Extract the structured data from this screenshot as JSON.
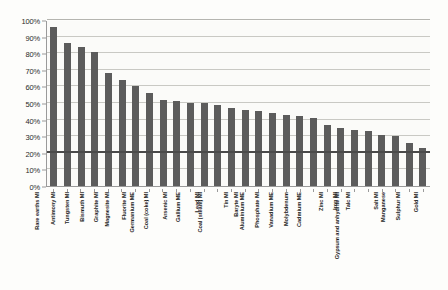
{
  "chart_data": {
    "type": "bar",
    "title": "",
    "subtitle": "",
    "xlabel": "",
    "ylabel": "",
    "ylim": [
      0,
      100
    ],
    "ytick_labels": [
      "0%",
      "10%",
      "20%",
      "30%",
      "40%",
      "50%",
      "60%",
      "70%",
      "80%",
      "90%",
      "100%"
    ],
    "ytick_values": [
      0,
      10,
      20,
      30,
      40,
      50,
      60,
      70,
      80,
      90,
      100
    ],
    "grid": true,
    "legend": "none",
    "bar_color": "#5c5c5c",
    "reference_line": {
      "value": 20,
      "label": "",
      "color": "#4a4a4a"
    },
    "categories": [
      "Rare earths MI",
      "Antimony MI",
      "Tungsten MI",
      "Bismuth MI",
      "Graphite MI",
      "Magnesite MI",
      "Fluorite MI",
      "Germanium ME",
      "Coal (coke) MI",
      "Arsenic MI",
      "Gallium ME",
      "Lead MI",
      "Coal (steam) MI",
      "Tin MI",
      "Baryte MI",
      "Aluminium ME",
      "Phosphate MI",
      "Vanadium ME",
      "Molybdenum",
      "Cadmium ME",
      "Zinc MI",
      "Iron MI",
      "Talc MI",
      "Gypsum and anhydrite MI",
      "Salt MI",
      "Manganese",
      "Sulphur MI",
      "Gold MI"
    ],
    "values": [
      96,
      86,
      84,
      81,
      68,
      64,
      60,
      56,
      52,
      51,
      50,
      50,
      49,
      47,
      46,
      45,
      44,
      43,
      42,
      41,
      37,
      35,
      34,
      33,
      31,
      30,
      26,
      23
    ]
  }
}
